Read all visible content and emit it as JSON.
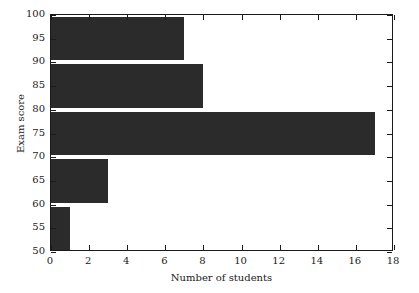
{
  "chart_data": {
    "type": "bar",
    "orientation": "horizontal",
    "title": "",
    "xlabel": "Number of students",
    "ylabel": "Exam score",
    "categories": [
      55,
      65,
      75,
      85,
      95
    ],
    "values": [
      1,
      3,
      17,
      8,
      7
    ],
    "bins": [
      {
        "center": 55,
        "low": 50,
        "high": 60,
        "count": 1
      },
      {
        "center": 65,
        "low": 60,
        "high": 70,
        "count": 3
      },
      {
        "center": 75,
        "low": 70,
        "high": 80,
        "count": 17
      },
      {
        "center": 85,
        "low": 80,
        "high": 90,
        "count": 8
      },
      {
        "center": 95,
        "low": 90,
        "high": 100,
        "count": 7
      }
    ],
    "xlim": [
      0,
      18
    ],
    "ylim": [
      50,
      100
    ],
    "xticks": [
      0,
      2,
      4,
      6,
      8,
      10,
      12,
      14,
      16,
      18
    ],
    "yticks": [
      50,
      55,
      60,
      65,
      70,
      75,
      80,
      85,
      90,
      95,
      100
    ],
    "xticklabels": [
      "0",
      "2",
      "4",
      "6",
      "8",
      "10",
      "12",
      "14",
      "16",
      "18"
    ],
    "yticklabels": [
      "50",
      "55",
      "60",
      "65",
      "70",
      "75",
      "80",
      "85",
      "90",
      "95",
      "100"
    ],
    "grid": false,
    "legend": null,
    "bar_color": "#2b2b2b",
    "axes_color": "#1a1a1a",
    "background": "#ffffff"
  }
}
